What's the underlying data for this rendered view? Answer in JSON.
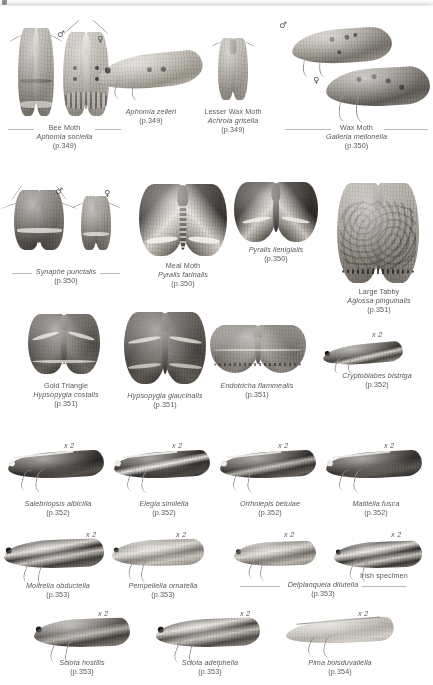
{
  "page": {
    "kind": "field-guide-plate",
    "background": "#ffffff",
    "text_color": "#58585a",
    "rule_color": "#b9b9bb",
    "symbols": {
      "male": "♂",
      "female": "♀"
    },
    "magnification_label": "x 2"
  },
  "figures": [
    {
      "id": "aphomia-sociella",
      "common_name": "Bee Moth",
      "scientific_name": "Aphomia sociella",
      "page_ref": "(p.349)",
      "sexes": [
        "♂",
        "♀"
      ],
      "bracketed": true,
      "magnified": false
    },
    {
      "id": "aphomia-zelleri",
      "common_name": "",
      "scientific_name": "Aphomia zelleri",
      "page_ref": "(p.349)",
      "sexes": [],
      "bracketed": false,
      "magnified": false
    },
    {
      "id": "achroia-grisella",
      "common_name": "Lesser Wax Moth",
      "scientific_name": "Achroia grisella",
      "page_ref": "(p.349)",
      "sexes": [],
      "bracketed": false,
      "magnified": false
    },
    {
      "id": "galleria-mellonella",
      "common_name": "Wax Moth",
      "scientific_name": "Galleria mellonella",
      "page_ref": "(p.350)",
      "sexes": [
        "♂",
        "♀"
      ],
      "bracketed": true,
      "magnified": false
    },
    {
      "id": "synaphe-punctalis",
      "common_name": "",
      "scientific_name": "Synaphe punctalis",
      "page_ref": "(p.350)",
      "sexes": [
        "♂",
        "♀"
      ],
      "bracketed": true,
      "magnified": false
    },
    {
      "id": "pyralis-farinalis",
      "common_name": "Meal Moth",
      "scientific_name": "Pyralis farinalis",
      "page_ref": "(p.350)",
      "sexes": [],
      "bracketed": false,
      "magnified": false
    },
    {
      "id": "pyralis-lienigialis",
      "common_name": "",
      "scientific_name": "Pyralis lienigialis",
      "page_ref": "(p.350)",
      "sexes": [],
      "bracketed": false,
      "magnified": false
    },
    {
      "id": "aglossa-pinguinalis",
      "common_name": "Large Tabby",
      "scientific_name": "Aglossa pinguinalis",
      "page_ref": "(p.351)",
      "sexes": [],
      "bracketed": false,
      "magnified": false
    },
    {
      "id": "hypsopygia-costalis",
      "common_name": "Gold Triangle",
      "scientific_name": "Hypsopygia costalis",
      "page_ref": "(p.351)",
      "sexes": [],
      "bracketed": false,
      "magnified": false
    },
    {
      "id": "hypsopygia-glaucinalis",
      "common_name": "",
      "scientific_name": "Hypsopygia glaucinalis",
      "page_ref": "(p.351)",
      "sexes": [],
      "bracketed": false,
      "magnified": false
    },
    {
      "id": "endotricha-flammealis",
      "common_name": "",
      "scientific_name": "Endotricha flammealis",
      "page_ref": "(p.351)",
      "sexes": [],
      "bracketed": false,
      "magnified": false
    },
    {
      "id": "cryptoblabes-bistriga",
      "common_name": "",
      "scientific_name": "Cryptoblabes bistriga",
      "page_ref": "(p.352)",
      "sexes": [],
      "bracketed": false,
      "magnified": true
    },
    {
      "id": "salebriopsis-albicilla",
      "common_name": "",
      "scientific_name": "Salebriopsis albicilla",
      "page_ref": "(p.352)",
      "sexes": [],
      "bracketed": false,
      "magnified": true
    },
    {
      "id": "elegia-similella",
      "common_name": "",
      "scientific_name": "Elegia similella",
      "page_ref": "(p.352)",
      "sexes": [],
      "bracketed": false,
      "magnified": true
    },
    {
      "id": "ortholepis-betulae",
      "common_name": "",
      "scientific_name": "Ortholepis betulae",
      "page_ref": "(p.352)",
      "sexes": [],
      "bracketed": false,
      "magnified": true
    },
    {
      "id": "matilella-fusca",
      "common_name": "",
      "scientific_name": "Matilella fusca",
      "page_ref": "(p.352)",
      "sexes": [],
      "bracketed": false,
      "magnified": true
    },
    {
      "id": "moitrelia-obductella",
      "common_name": "",
      "scientific_name": "Moitrelia obductella",
      "page_ref": "(p.353)",
      "sexes": [],
      "bracketed": false,
      "magnified": true
    },
    {
      "id": "pempeliella-ornatella",
      "common_name": "",
      "scientific_name": "Pempeliella ornatella",
      "page_ref": "(p.353)",
      "sexes": [],
      "bracketed": false,
      "magnified": true
    },
    {
      "id": "delplanqueia-dilutella",
      "common_name": "",
      "scientific_name": "Delplanqueia dilutella",
      "page_ref": "(p.353)",
      "annotation": "Irish specimen",
      "sexes": [],
      "bracketed": true,
      "magnified": true
    },
    {
      "id": "sciota-hostilis",
      "common_name": "",
      "scientific_name": "Sciota hostilis",
      "page_ref": "(p.353)",
      "sexes": [],
      "bracketed": false,
      "magnified": true
    },
    {
      "id": "sciota-adelphella",
      "common_name": "",
      "scientific_name": "Sciota adelphella",
      "page_ref": "(p.353)",
      "sexes": [],
      "bracketed": false,
      "magnified": true
    },
    {
      "id": "pima-boisduvaliella",
      "common_name": "",
      "scientific_name": "Pima boisduvaliella",
      "page_ref": "(p.354)",
      "sexes": [],
      "bracketed": false,
      "magnified": true
    }
  ]
}
